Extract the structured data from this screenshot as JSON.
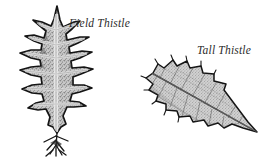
{
  "plate": {
    "title": "Thistle leaf comparison",
    "background_color": "#ffffff",
    "ink_color": "#1a1a1a",
    "fill_color": "#b9b9b9",
    "text_color": "#2b2b2b",
    "specimens": [
      {
        "id": "field-thistle",
        "label": "Field Thistle",
        "description": "Deeply pinnatifid leaf with about five pairs of spine-tipped lobes, upright orientation, narrow winged base",
        "orientation": "upright",
        "lobe_pairs": 5,
        "margin": "deeply lobed, spiny",
        "texture": "stippled gray"
      },
      {
        "id": "tall-thistle",
        "label": "Tall Thistle",
        "description": "Shallowly lobed lance-shaped leaf with prominent reticulate venation, angled from upper left to lower right, tapering to a sharp point",
        "orientation": "diagonal",
        "lobe_pairs": 5,
        "margin": "shallowly lobed, toothed",
        "texture": "fine reticulate venation"
      }
    ]
  }
}
